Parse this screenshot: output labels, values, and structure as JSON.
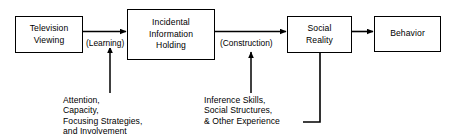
{
  "diagram": {
    "colors": {
      "background": "#ffffff",
      "stroke": "#000000",
      "text": "#000000"
    },
    "nodes": [
      {
        "id": "television-viewing",
        "label": "Television\nViewing"
      },
      {
        "id": "incidental-information-holding",
        "label": "Incidental\nInformation\nHolding"
      },
      {
        "id": "social-reality",
        "label": "Social\nReality"
      },
      {
        "id": "behavior",
        "label": "Behavior"
      }
    ],
    "edge_labels": [
      {
        "id": "learning",
        "text": "(Learning)"
      },
      {
        "id": "construction",
        "text": "(Construction)"
      }
    ],
    "notes": [
      {
        "id": "learning-factors",
        "text": "Attention,\nCapacity,\nFocusing Strategies,\nand Involvement"
      },
      {
        "id": "construction-factors",
        "text": "Inference Skills,\nSocial Structures,\n& Other Experience"
      }
    ]
  }
}
